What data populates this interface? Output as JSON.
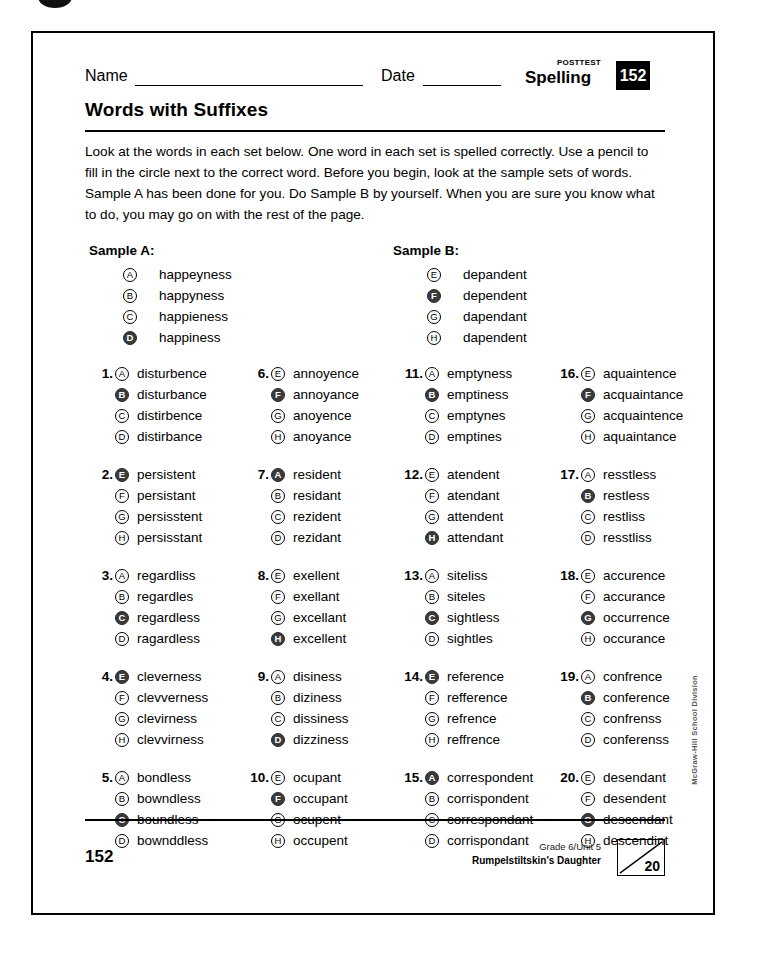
{
  "header": {
    "name_label": "Name",
    "date_label": "Date",
    "posttest_label": "POSTTEST",
    "subject_label": "Spelling",
    "page_badge": "152",
    "title": "Words with Suffixes",
    "instructions": "Look at the words in each set below. One word in each set is spelled correctly. Use a pencil to fill in the circle next to the correct word. Before you begin, look at the sample sets of words. Sample A has been done for you. Do Sample B by yourself. When you are sure you know what to do, you may go on with the rest of the page."
  },
  "samples": [
    {
      "heading": "Sample A:",
      "options": [
        {
          "letter": "A",
          "word": "happeyness",
          "filled": false
        },
        {
          "letter": "B",
          "word": "happyness",
          "filled": false
        },
        {
          "letter": "C",
          "word": "happieness",
          "filled": false
        },
        {
          "letter": "D",
          "word": "happiness",
          "filled": true
        }
      ]
    },
    {
      "heading": "Sample B:",
      "options": [
        {
          "letter": "E",
          "word": "depandent",
          "filled": false
        },
        {
          "letter": "F",
          "word": "dependent",
          "filled": true
        },
        {
          "letter": "G",
          "word": "dapendant",
          "filled": false
        },
        {
          "letter": "H",
          "word": "dapendent",
          "filled": false
        }
      ]
    }
  ],
  "columns": [
    [
      {
        "number": "1.",
        "options": [
          {
            "letter": "A",
            "word": "disturbence",
            "filled": false
          },
          {
            "letter": "B",
            "word": "disturbance",
            "filled": true
          },
          {
            "letter": "C",
            "word": "distirbence",
            "filled": false
          },
          {
            "letter": "D",
            "word": "distirbance",
            "filled": false
          }
        ]
      },
      {
        "number": "2.",
        "options": [
          {
            "letter": "E",
            "word": "persistent",
            "filled": true
          },
          {
            "letter": "F",
            "word": "persistant",
            "filled": false
          },
          {
            "letter": "G",
            "word": "persisstent",
            "filled": false
          },
          {
            "letter": "H",
            "word": "persisstant",
            "filled": false
          }
        ]
      },
      {
        "number": "3.",
        "options": [
          {
            "letter": "A",
            "word": "regardliss",
            "filled": false
          },
          {
            "letter": "B",
            "word": "regardles",
            "filled": false
          },
          {
            "letter": "C",
            "word": "regardless",
            "filled": true
          },
          {
            "letter": "D",
            "word": "ragardless",
            "filled": false
          }
        ]
      },
      {
        "number": "4.",
        "options": [
          {
            "letter": "E",
            "word": "cleverness",
            "filled": true
          },
          {
            "letter": "F",
            "word": "clevverness",
            "filled": false
          },
          {
            "letter": "G",
            "word": "clevirness",
            "filled": false
          },
          {
            "letter": "H",
            "word": "clevvirness",
            "filled": false
          }
        ]
      },
      {
        "number": "5.",
        "options": [
          {
            "letter": "A",
            "word": "bondless",
            "filled": false
          },
          {
            "letter": "B",
            "word": "bowndless",
            "filled": false
          },
          {
            "letter": "C",
            "word": "boundless",
            "filled": true
          },
          {
            "letter": "D",
            "word": "bownddless",
            "filled": false
          }
        ]
      }
    ],
    [
      {
        "number": "6.",
        "options": [
          {
            "letter": "E",
            "word": "annoyence",
            "filled": false
          },
          {
            "letter": "F",
            "word": "annoyance",
            "filled": true
          },
          {
            "letter": "G",
            "word": "anoyence",
            "filled": false
          },
          {
            "letter": "H",
            "word": "anoyance",
            "filled": false
          }
        ]
      },
      {
        "number": "7.",
        "options": [
          {
            "letter": "A",
            "word": "resident",
            "filled": true
          },
          {
            "letter": "B",
            "word": "residant",
            "filled": false
          },
          {
            "letter": "C",
            "word": "rezident",
            "filled": false
          },
          {
            "letter": "D",
            "word": "rezidant",
            "filled": false
          }
        ]
      },
      {
        "number": "8.",
        "options": [
          {
            "letter": "E",
            "word": "exellent",
            "filled": false
          },
          {
            "letter": "F",
            "word": "exellant",
            "filled": false
          },
          {
            "letter": "G",
            "word": "excellant",
            "filled": false
          },
          {
            "letter": "H",
            "word": "excellent",
            "filled": true
          }
        ]
      },
      {
        "number": "9.",
        "options": [
          {
            "letter": "A",
            "word": "disiness",
            "filled": false
          },
          {
            "letter": "B",
            "word": "diziness",
            "filled": false
          },
          {
            "letter": "C",
            "word": "dissiness",
            "filled": false
          },
          {
            "letter": "D",
            "word": "dizziness",
            "filled": true
          }
        ]
      },
      {
        "number": "10.",
        "options": [
          {
            "letter": "E",
            "word": "ocupant",
            "filled": false
          },
          {
            "letter": "F",
            "word": "occupant",
            "filled": true
          },
          {
            "letter": "G",
            "word": "ocupent",
            "filled": false
          },
          {
            "letter": "H",
            "word": "occupent",
            "filled": false
          }
        ]
      }
    ],
    [
      {
        "number": "11.",
        "options": [
          {
            "letter": "A",
            "word": "emptyness",
            "filled": false
          },
          {
            "letter": "B",
            "word": "emptiness",
            "filled": true
          },
          {
            "letter": "C",
            "word": "emptynes",
            "filled": false
          },
          {
            "letter": "D",
            "word": "emptines",
            "filled": false
          }
        ]
      },
      {
        "number": "12.",
        "options": [
          {
            "letter": "E",
            "word": "atendent",
            "filled": false
          },
          {
            "letter": "F",
            "word": "atendant",
            "filled": false
          },
          {
            "letter": "G",
            "word": "attendent",
            "filled": false
          },
          {
            "letter": "H",
            "word": "attendant",
            "filled": true
          }
        ]
      },
      {
        "number": "13.",
        "options": [
          {
            "letter": "A",
            "word": "siteliss",
            "filled": false
          },
          {
            "letter": "B",
            "word": "siteles",
            "filled": false
          },
          {
            "letter": "C",
            "word": "sightless",
            "filled": true
          },
          {
            "letter": "D",
            "word": "sightles",
            "filled": false
          }
        ]
      },
      {
        "number": "14.",
        "options": [
          {
            "letter": "E",
            "word": "reference",
            "filled": true
          },
          {
            "letter": "F",
            "word": "refference",
            "filled": false
          },
          {
            "letter": "G",
            "word": "refrence",
            "filled": false
          },
          {
            "letter": "H",
            "word": "reffrence",
            "filled": false
          }
        ]
      },
      {
        "number": "15.",
        "options": [
          {
            "letter": "A",
            "word": "correspondent",
            "filled": true
          },
          {
            "letter": "B",
            "word": "corrispondent",
            "filled": false
          },
          {
            "letter": "C",
            "word": "correspondant",
            "filled": false
          },
          {
            "letter": "D",
            "word": "corrispondant",
            "filled": false
          }
        ]
      }
    ],
    [
      {
        "number": "16.",
        "options": [
          {
            "letter": "E",
            "word": "aquaintence",
            "filled": false
          },
          {
            "letter": "F",
            "word": "acquaintance",
            "filled": true
          },
          {
            "letter": "G",
            "word": "acquaintence",
            "filled": false
          },
          {
            "letter": "H",
            "word": "aquaintance",
            "filled": false
          }
        ]
      },
      {
        "number": "17.",
        "options": [
          {
            "letter": "A",
            "word": "resstless",
            "filled": false
          },
          {
            "letter": "B",
            "word": "restless",
            "filled": true
          },
          {
            "letter": "C",
            "word": "restliss",
            "filled": false
          },
          {
            "letter": "D",
            "word": "resstliss",
            "filled": false
          }
        ]
      },
      {
        "number": "18.",
        "options": [
          {
            "letter": "E",
            "word": "accurence",
            "filled": false
          },
          {
            "letter": "F",
            "word": "accurance",
            "filled": false
          },
          {
            "letter": "G",
            "word": "occurrence",
            "filled": true
          },
          {
            "letter": "H",
            "word": "occurance",
            "filled": false
          }
        ]
      },
      {
        "number": "19.",
        "options": [
          {
            "letter": "A",
            "word": "confrence",
            "filled": false
          },
          {
            "letter": "B",
            "word": "conference",
            "filled": true
          },
          {
            "letter": "C",
            "word": "confrenss",
            "filled": false
          },
          {
            "letter": "D",
            "word": "conferenss",
            "filled": false
          }
        ]
      },
      {
        "number": "20.",
        "options": [
          {
            "letter": "E",
            "word": "desendant",
            "filled": false
          },
          {
            "letter": "F",
            "word": "desendent",
            "filled": false
          },
          {
            "letter": "G",
            "word": "descendant",
            "filled": true
          },
          {
            "letter": "H",
            "word": "descendint",
            "filled": false
          }
        ]
      }
    ]
  ],
  "side_credit": "McGraw-Hill School Division",
  "footer": {
    "page_number": "152",
    "unit": "Grade 6/Unit 5",
    "story": "Rumpelstiltskin's Daughter",
    "score_total": "20"
  }
}
